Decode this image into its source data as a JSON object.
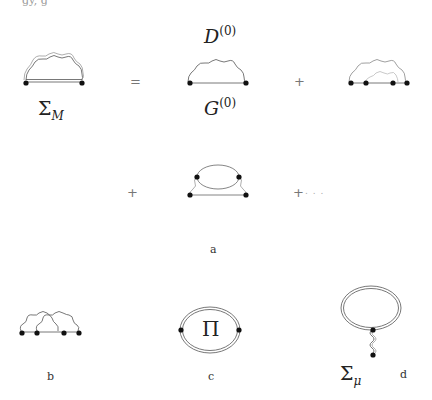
{
  "top_fragment": "gy, g",
  "equation": {
    "lhs_label_symbol": "Σ",
    "lhs_label_sub": "M",
    "equals": "=",
    "term1_top_symbol": "D",
    "term1_top_sup": "(0)",
    "term1_bottom_symbol": "G",
    "term1_bottom_sup": "(0)",
    "plus1": "+",
    "plus2": "+",
    "plus3": "+",
    "ellipsis": ". . ."
  },
  "captions": {
    "a": "a",
    "b": "b",
    "c": "c",
    "d": "d"
  },
  "diagram_c": {
    "center_symbol": "Π"
  },
  "diagram_d": {
    "label_symbol": "Σ",
    "label_sub": "μ"
  }
}
